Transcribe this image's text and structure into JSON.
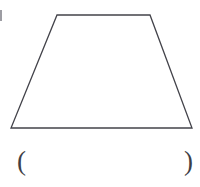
{
  "figure": {
    "background_color": "#ffffff",
    "width": 200,
    "height": 187,
    "shape": {
      "name": "trapezoid",
      "type": "isosceles-trapezoid",
      "stroke_color": "#43434a",
      "stroke_width": 1.3,
      "fill": "none",
      "vertices": [
        {
          "label": "top-left",
          "x": 57,
          "y": 15
        },
        {
          "label": "top-right",
          "x": 150,
          "y": 15
        },
        {
          "label": "bottom-right",
          "x": 192,
          "y": 128
        },
        {
          "label": "bottom-left",
          "x": 11,
          "y": 128
        }
      ],
      "points_attr": "57,15 150,15 192,128 11,128"
    },
    "artifact": {
      "name": "clipped-stroke-fragment",
      "color": "#8c8c93"
    }
  },
  "answer": {
    "open_paren": "(",
    "close_paren": ")",
    "value": "",
    "placeholder": ""
  }
}
